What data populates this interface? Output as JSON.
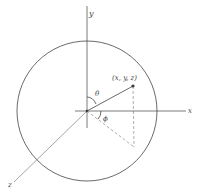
{
  "diagram": {
    "labels": {
      "x_axis": "x",
      "y_axis": "y",
      "z_axis": "z",
      "point": "(x, y, z)",
      "theta": "θ",
      "phi": "ϕ"
    },
    "colors": {
      "stroke": "#444444",
      "background": "#ffffff"
    }
  }
}
